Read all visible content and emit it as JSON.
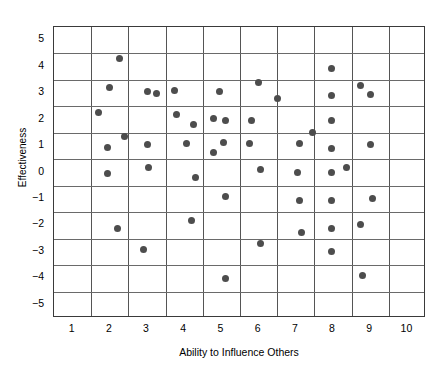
{
  "chart_data": {
    "type": "scatter",
    "title": "",
    "xlabel": "Ability to Influence Others",
    "ylabel": "Effectiveness",
    "xlim": [
      0.5,
      10.5
    ],
    "ylim": [
      -5.5,
      5.5
    ],
    "xticks": [
      1,
      2,
      3,
      4,
      5,
      6,
      7,
      8,
      9,
      10
    ],
    "yticks": [
      5,
      4,
      3,
      2,
      1,
      0,
      -1,
      -2,
      -3,
      -4,
      -5
    ],
    "xtick_labels": [
      "1",
      "2",
      "3",
      "4",
      "5",
      "6",
      "7",
      "8",
      "9",
      "10"
    ],
    "ytick_labels": [
      "5",
      "4",
      "3",
      "2",
      "1",
      "0",
      "−1",
      "−2",
      "−3",
      "−4",
      "−5"
    ],
    "grid": "major-and-half-steps",
    "grid_x_at": [
      1.5,
      2.5,
      3.5,
      4.5,
      5.5,
      6.5,
      7.5,
      8.5,
      9.5
    ],
    "grid_y_at": [
      4.5,
      3.5,
      2.5,
      1.5,
      0.5,
      -0.5,
      -1.5,
      -2.5,
      -3.5,
      -4.5
    ],
    "legend": null,
    "marker": "filled-circle",
    "marker_color": "#4d4d4d",
    "marker_size_px": 7,
    "frame_color": "#3a3a3a",
    "background": "#ffffff",
    "n_points": 46,
    "points": [
      {
        "x": 1.7,
        "y": 2.25
      },
      {
        "x": 1.95,
        "y": 0.95
      },
      {
        "x": 1.95,
        "y": -0.05
      },
      {
        "x": 2.0,
        "y": 3.2
      },
      {
        "x": 2.2,
        "y": -2.1
      },
      {
        "x": 2.25,
        "y": 4.3
      },
      {
        "x": 2.4,
        "y": 1.35
      },
      {
        "x": 2.9,
        "y": -2.9
      },
      {
        "x": 3.0,
        "y": 3.05
      },
      {
        "x": 3.0,
        "y": 1.05
      },
      {
        "x": 3.05,
        "y": 0.2
      },
      {
        "x": 3.25,
        "y": 3.0
      },
      {
        "x": 3.75,
        "y": 3.1
      },
      {
        "x": 3.8,
        "y": 2.2
      },
      {
        "x": 4.05,
        "y": 1.1
      },
      {
        "x": 4.2,
        "y": -1.8
      },
      {
        "x": 4.25,
        "y": 1.8
      },
      {
        "x": 4.3,
        "y": -0.2
      },
      {
        "x": 4.8,
        "y": 2.05
      },
      {
        "x": 4.8,
        "y": 0.75
      },
      {
        "x": 4.95,
        "y": 3.05
      },
      {
        "x": 5.05,
        "y": 1.15
      },
      {
        "x": 5.1,
        "y": 1.95
      },
      {
        "x": 5.1,
        "y": -0.9
      },
      {
        "x": 5.1,
        "y": -4.0
      },
      {
        "x": 5.75,
        "y": 1.1
      },
      {
        "x": 5.8,
        "y": 1.95
      },
      {
        "x": 6.0,
        "y": 3.4
      },
      {
        "x": 6.05,
        "y": 0.1
      },
      {
        "x": 6.05,
        "y": -2.7
      },
      {
        "x": 6.5,
        "y": 2.8
      },
      {
        "x": 7.05,
        "y": 0.0
      },
      {
        "x": 7.1,
        "y": 1.1
      },
      {
        "x": 7.1,
        "y": -1.05
      },
      {
        "x": 7.15,
        "y": -2.25
      },
      {
        "x": 7.45,
        "y": 1.5
      },
      {
        "x": 7.95,
        "y": 3.95
      },
      {
        "x": 7.95,
        "y": 2.9
      },
      {
        "x": 7.95,
        "y": 1.95
      },
      {
        "x": 7.95,
        "y": 0.9
      },
      {
        "x": 7.95,
        "y": 0.0
      },
      {
        "x": 7.95,
        "y": -1.05
      },
      {
        "x": 7.95,
        "y": -2.1
      },
      {
        "x": 7.95,
        "y": -3.0
      },
      {
        "x": 8.35,
        "y": 0.2
      },
      {
        "x": 8.75,
        "y": 3.3
      },
      {
        "x": 8.75,
        "y": -1.95
      },
      {
        "x": 8.8,
        "y": -3.9
      },
      {
        "x": 9.0,
        "y": 2.95
      },
      {
        "x": 9.0,
        "y": 1.05
      },
      {
        "x": 9.05,
        "y": -1.0
      }
    ]
  }
}
